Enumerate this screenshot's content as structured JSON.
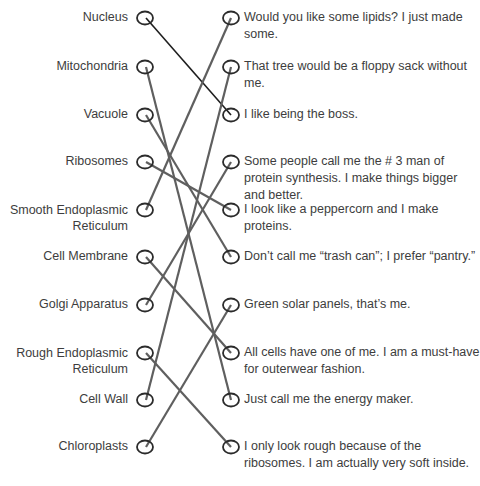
{
  "left_items": [
    {
      "label": "Nucleus",
      "y": 18
    },
    {
      "label": "Mitochondria",
      "y": 67
    },
    {
      "label": "Vacuole",
      "y": 115
    },
    {
      "label": "Ribosomes",
      "y": 162
    },
    {
      "label": "Smooth Endoplasmic Reticulum",
      "line1": "Smooth Endoplasmic",
      "line2": "Reticulum",
      "y": 210
    },
    {
      "label": "Cell Membrane",
      "y": 257
    },
    {
      "label": "Golgi Apparatus",
      "y": 305
    },
    {
      "label": "Rough Endoplasmic Reticulum",
      "line1": "Rough Endoplasmic",
      "line2": "Reticulum",
      "y": 353
    },
    {
      "label": "Cell Wall",
      "y": 400
    },
    {
      "label": "Chloroplasts",
      "y": 447
    }
  ],
  "right_items": [
    {
      "text": "Would you like some lipids? I just made some.",
      "y": 18
    },
    {
      "text": "That tree would be a floppy sack without me.",
      "y": 67
    },
    {
      "text": "I like being the boss.",
      "y": 115
    },
    {
      "text": "Some people call me the # 3 man of protein synthesis. I make things bigger and better.",
      "y": 162
    },
    {
      "text": "I look like a peppercorn and I make proteins.",
      "y": 210
    },
    {
      "text": "Don’t call me “trash can”; I prefer “pantry.”",
      "y": 257
    },
    {
      "text": "Green solar panels, that’s me.",
      "y": 305
    },
    {
      "text": "All cells have one of me. I am a must-have for outerwear fashion.",
      "y": 353
    },
    {
      "text": "Just call me the energy maker.",
      "y": 400
    },
    {
      "text": "I only look rough because of the ribosomes. I am actually very soft inside.",
      "y": 447
    }
  ],
  "connections": [
    {
      "from": "Nucleus",
      "to": "I like being the boss.",
      "left_index": 0,
      "right_index": 2,
      "color": "#1e1e1e"
    },
    {
      "from": "Mitochondria",
      "to": "Just call me the energy maker.",
      "left_index": 1,
      "right_index": 8,
      "color": "#5f5f5f"
    },
    {
      "from": "Vacuole",
      "to": "Don’t call me “trash can”; I prefer “pantry.”",
      "left_index": 2,
      "right_index": 5,
      "color": "#5f5f5f"
    },
    {
      "from": "Ribosomes",
      "to": "I look like a peppercorn and I make proteins.",
      "left_index": 3,
      "right_index": 4,
      "color": "#5f5f5f"
    },
    {
      "from": "Smooth Endoplasmic Reticulum",
      "to": "Would you like some lipids? I just made some.",
      "left_index": 4,
      "right_index": 0,
      "color": "#5f5f5f"
    },
    {
      "from": "Cell Membrane",
      "to": "All cells have one of me. I am a must-have for outerwear fashion.",
      "left_index": 5,
      "right_index": 7,
      "color": "#5f5f5f"
    },
    {
      "from": "Golgi Apparatus",
      "to": "Some people call me the # 3 man of protein synthesis. I make things bigger and better.",
      "left_index": 6,
      "right_index": 3,
      "color": "#5f5f5f"
    },
    {
      "from": "Rough Endoplasmic Reticulum",
      "to": "I only look rough because of the ribosomes. I am actually very soft inside.",
      "left_index": 7,
      "right_index": 9,
      "color": "#5f5f5f"
    },
    {
      "from": "Cell Wall",
      "to": "That tree would be a floppy sack without me.",
      "left_index": 8,
      "right_index": 1,
      "color": "#5f5f5f"
    },
    {
      "from": "Chloroplasts",
      "to": "Green solar panels, that’s me.",
      "left_index": 9,
      "right_index": 6,
      "color": "#5f5f5f"
    }
  ],
  "colors": {
    "circle_stroke": "#2b2b2b",
    "line": "#5f5f5f",
    "text": "#3d3d3d"
  }
}
